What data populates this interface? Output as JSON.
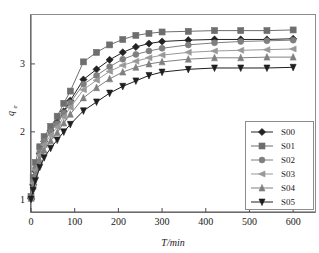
{
  "chart_data": {
    "type": "line",
    "title": "",
    "xlabel": "T/min",
    "ylabel": "qe",
    "ylabel_base": "q",
    "ylabel_sub": "e",
    "xlim": [
      0,
      650
    ],
    "ylim": [
      0.82,
      3.72
    ],
    "xticks": [
      0,
      100,
      200,
      300,
      400,
      500,
      600
    ],
    "xtick_labels": [
      "0",
      "100",
      "200",
      "300",
      "400",
      "500",
      "600"
    ],
    "yticks": [
      1,
      2,
      3
    ],
    "ytick_labels": [
      "1",
      "2",
      "3"
    ],
    "grid": false,
    "legend_position": "lower-right",
    "x": [
      0,
      5,
      10,
      20,
      30,
      45,
      60,
      75,
      90,
      120,
      150,
      180,
      210,
      240,
      270,
      300,
      360,
      420,
      480,
      540,
      600
    ],
    "series": [
      {
        "name": "S00",
        "marker": "diamond",
        "color": "#222222",
        "values": [
          1.02,
          1.22,
          1.42,
          1.68,
          1.86,
          2.02,
          2.14,
          2.3,
          2.46,
          2.77,
          2.92,
          3.06,
          3.17,
          3.25,
          3.3,
          3.33,
          3.35,
          3.36,
          3.36,
          3.36,
          3.37
        ]
      },
      {
        "name": "S01",
        "marker": "square",
        "color": "#6e6e6e",
        "values": [
          1.05,
          1.33,
          1.55,
          1.78,
          1.93,
          2.08,
          2.23,
          2.42,
          2.6,
          3.03,
          3.17,
          3.28,
          3.36,
          3.42,
          3.45,
          3.47,
          3.48,
          3.49,
          3.49,
          3.49,
          3.5
        ]
      },
      {
        "name": "S02",
        "marker": "circle",
        "color": "#7f7f7f",
        "values": [
          1.04,
          1.27,
          1.46,
          1.7,
          1.86,
          2.0,
          2.12,
          2.28,
          2.43,
          2.7,
          2.83,
          2.96,
          3.07,
          3.14,
          3.19,
          3.23,
          3.28,
          3.31,
          3.33,
          3.34,
          3.35
        ]
      },
      {
        "name": "S03",
        "marker": "triangle-left",
        "color": "#999999",
        "values": [
          1.03,
          1.24,
          1.43,
          1.66,
          1.81,
          1.95,
          2.07,
          2.22,
          2.36,
          2.62,
          2.76,
          2.89,
          2.98,
          3.04,
          3.09,
          3.13,
          3.17,
          3.19,
          3.2,
          3.21,
          3.22
        ]
      },
      {
        "name": "S04",
        "marker": "triangle-up",
        "color": "#808080",
        "values": [
          1.02,
          1.2,
          1.37,
          1.58,
          1.73,
          1.87,
          1.99,
          2.13,
          2.26,
          2.5,
          2.65,
          2.78,
          2.88,
          2.95,
          3.0,
          3.03,
          3.07,
          3.09,
          3.09,
          3.1,
          3.1
        ]
      },
      {
        "name": "S05",
        "marker": "triangle-down",
        "color": "#1f1f1f",
        "values": [
          1.01,
          1.14,
          1.28,
          1.48,
          1.62,
          1.76,
          1.88,
          2.0,
          2.11,
          2.31,
          2.44,
          2.57,
          2.67,
          2.75,
          2.83,
          2.88,
          2.92,
          2.94,
          2.94,
          2.94,
          2.95
        ]
      }
    ],
    "legend_entries": [
      "S00",
      "S01",
      "S02",
      "S03",
      "S04",
      "S05"
    ]
  }
}
